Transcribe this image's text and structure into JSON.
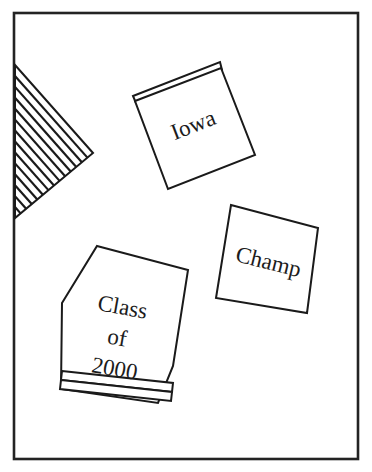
{
  "figure": {
    "background_color": "#ffffff",
    "line_color": "#1a1a1a",
    "frame": {
      "name": "outer-border-frame",
      "color": "#232323",
      "x": 14,
      "y": 13,
      "width": 344,
      "height": 446
    },
    "hatched_triangle": {
      "name": "hatched-corner-triangle",
      "points": "15,65 93,153 15,218",
      "hatch_line_count": 13,
      "hatch_color": "#1a1a1a"
    },
    "patches": [
      {
        "id": "iowa-patch",
        "label": "Iowa",
        "shape": "square-with-top-strip",
        "body_points": "135,101 221,68 255,155 168,189",
        "strip_points": "133,96 220,62 222,70 136,103",
        "label_x": 194,
        "label_y": 127,
        "label_rotation": -21,
        "label_size": "big"
      },
      {
        "id": "champ-patch",
        "label": "Champ",
        "shape": "square",
        "body_points": "231,205 318,228 307,313 216,298",
        "strip_points": "",
        "label_x": 268,
        "label_y": 264,
        "label_rotation": 14,
        "label_size": "big"
      },
      {
        "id": "class-of-2000-patch",
        "label_lines": [
          "Class",
          "of",
          "2000"
        ],
        "shape": "pentagon-banner-with-bottom-strips",
        "body_points": "97,246 188,270 173,366 158,403 61,389 62,303",
        "strip_points": "",
        "label_x": 125,
        "label_y": 310,
        "label_rotation": 10,
        "label_size": "big"
      }
    ],
    "class_patch_strips": [
      {
        "name": "class-patch-strip-upper",
        "points": "62,371 173,383 172,392 61,380"
      },
      {
        "name": "class-patch-strip-lower",
        "points": "61,380 172,392 171,401 60,389"
      }
    ]
  }
}
